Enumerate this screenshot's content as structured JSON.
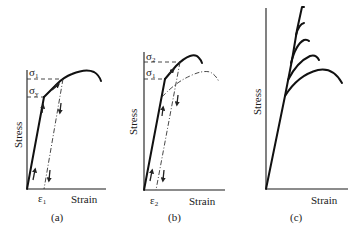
{
  "figure": {
    "panels": [
      {
        "id": "a",
        "caption": "(a)",
        "ylabel": "Stress",
        "xlabel": "Strain",
        "stress_labels": [
          "σ",
          "σ"
        ],
        "stress_subs": [
          "1",
          "y"
        ],
        "strain_label": "ε",
        "strain_sub": "1",
        "description": "Loading past yield to σ1, unloading elastically to permanent strain ε1, reloading"
      },
      {
        "id": "b",
        "caption": "(b)",
        "ylabel": "Stress",
        "xlabel": "Strain",
        "stress_labels": [
          "σ",
          "σ"
        ],
        "stress_subs": [
          "2",
          "1"
        ],
        "strain_label": "ε",
        "strain_sub": "2",
        "description": "Reloading yields at σ1, continues to σ2; dashed curve shows original stress-strain curve"
      },
      {
        "id": "c",
        "caption": "(c)",
        "ylabel": "Stress",
        "xlabel": "Strain",
        "description": "Family of stress-strain curves branching from a common elastic line"
      }
    ]
  }
}
